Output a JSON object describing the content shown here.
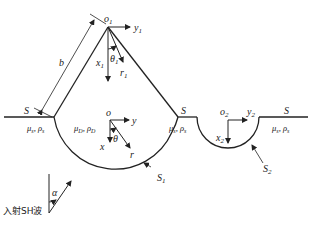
{
  "diagram": {
    "type": "geometry-schematic",
    "labels": {
      "apex_origin": "o",
      "apex_origin_sub": "1",
      "apex_y": "y",
      "apex_y_sub": "1",
      "apex_x": "x",
      "apex_x_sub": "1",
      "apex_theta": "θ",
      "apex_theta_sub": "1",
      "apex_r": "r",
      "apex_r_sub": "1",
      "side_length": "b",
      "surface_left": "S",
      "surface_mid": "S",
      "surface_right": "S",
      "medium_left": "μ",
      "medium_left_rest": "s, ρ",
      "medium_left_sub": "s",
      "medium_inner": "μ",
      "medium_inner_sub": "D",
      "medium_inner_rest": ", ρ",
      "medium_inner_sub2": "D",
      "medium_mid": "μ",
      "medium_mid_rest": "s, ρ",
      "medium_mid_sub": "s",
      "medium_right": "μ",
      "medium_right_rest": "s, ρ",
      "medium_right_sub": "s",
      "center_origin": "o",
      "center_y": "y",
      "center_x": "x",
      "center_theta": "θ",
      "center_r": "r",
      "boundary1": "S",
      "boundary1_sub": "1",
      "canyon_origin": "o",
      "canyon_origin_sub": "2",
      "canyon_y": "y",
      "canyon_y_sub": "2",
      "canyon_x": "x",
      "canyon_x_sub": "2",
      "boundary2": "S",
      "boundary2_sub": "2",
      "incident_angle": "α",
      "incident_label": "入射SH波"
    },
    "colors": {
      "stroke": "#222222",
      "text": "#222222",
      "background": "#ffffff"
    }
  }
}
